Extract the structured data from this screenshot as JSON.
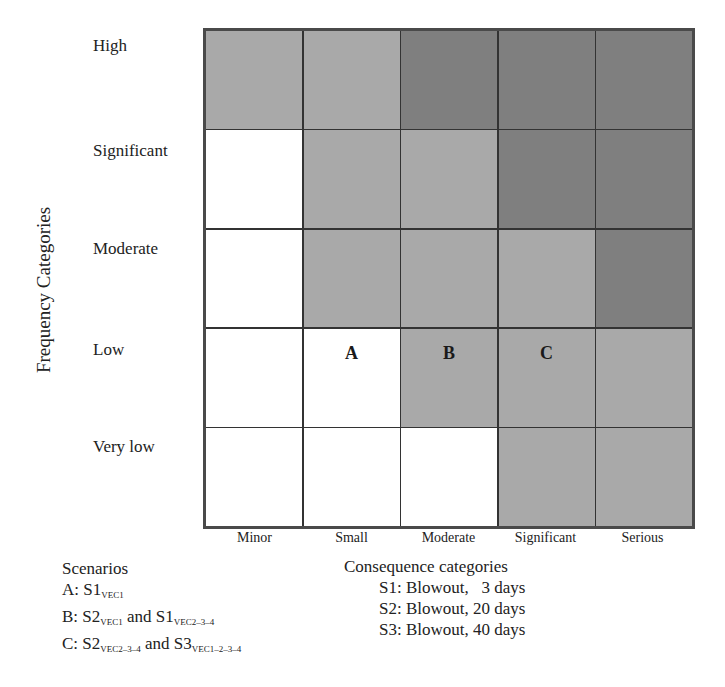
{
  "chart_data": {
    "type": "heatmap",
    "title": "",
    "ylabel": "Frequency Categories",
    "xlabel": "Consequence categories",
    "rows": [
      "High",
      "Significant",
      "Moderate",
      "Low",
      "Very low"
    ],
    "columns": [
      "Minor",
      "Small",
      "Moderate",
      "Significant",
      "Serious"
    ],
    "levels": {
      "white": "#ffffff",
      "medium": "#a9a9a9",
      "dark": "#7f7f7f"
    },
    "cells": [
      [
        "medium",
        "medium",
        "dark",
        "dark",
        "dark"
      ],
      [
        "white",
        "medium",
        "medium",
        "dark",
        "dark"
      ],
      [
        "white",
        "medium",
        "medium",
        "medium",
        "dark"
      ],
      [
        "white",
        "white",
        "medium",
        "medium",
        "medium"
      ],
      [
        "white",
        "white",
        "white",
        "medium",
        "medium"
      ]
    ],
    "annotations": [
      {
        "label": "A",
        "row": "Low",
        "column": "Small"
      },
      {
        "label": "B",
        "row": "Low",
        "column": "Moderate"
      },
      {
        "label": "C",
        "row": "Low",
        "column": "Significant"
      }
    ],
    "grid": true
  },
  "axis": {
    "y_title": "Frequency Categories",
    "rows": [
      "High",
      "Significant",
      "Moderate",
      "Low",
      "Very low"
    ],
    "cols": [
      "Minor",
      "Small",
      "Moderate",
      "Significant",
      "Serious"
    ]
  },
  "scenarios": {
    "title": "Scenarios",
    "a": {
      "prefix": "A: S1",
      "sub1": "VEC1"
    },
    "b": {
      "prefix": "B: S2",
      "sub1": "VEC1",
      "mid": " and S1",
      "sub2": "VEC2–3–4"
    },
    "c": {
      "prefix": "C: S2",
      "sub1": "VEC2–3–4",
      "mid": " and S3",
      "sub2": "VEC1–2–3–4"
    }
  },
  "consequences": {
    "title": "Consequence categories",
    "items": [
      "S1: Blowout,   3 days",
      "S2: Blowout, 20 days",
      "S3: Blowout, 40 days"
    ]
  }
}
